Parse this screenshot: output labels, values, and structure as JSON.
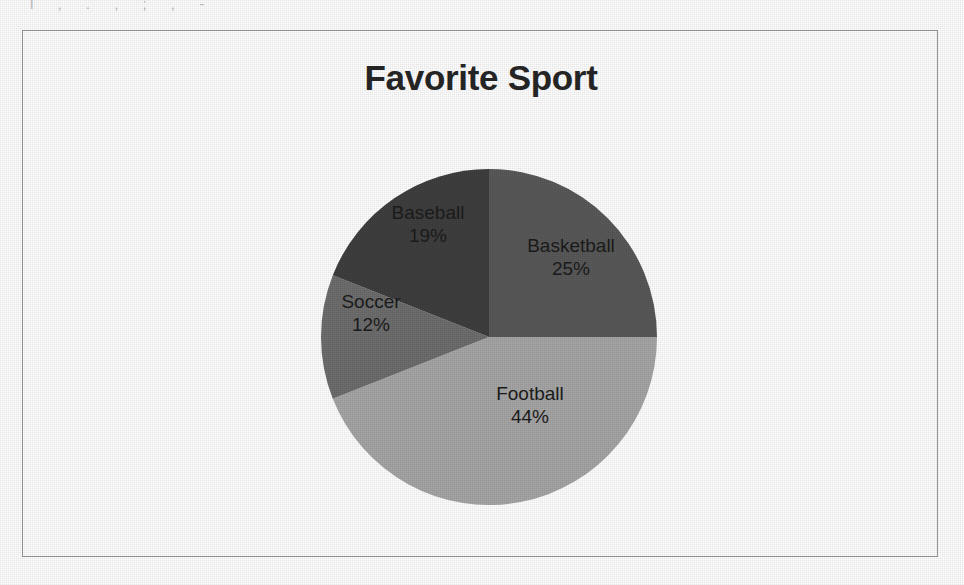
{
  "page": {
    "background_color": "#ffffff",
    "frame_border_color": "#9a9a9a",
    "top_text_remnant": "l  ,   .    ,   ;   ,   -"
  },
  "chart_data": {
    "type": "pie",
    "title": "Favorite Sport",
    "xlabel": "",
    "ylabel": "",
    "legend": "none",
    "labels_position": "inside-slices",
    "start_angle_deg": 0,
    "direction": "clockwise",
    "categories": [
      "Basketball",
      "Football",
      "Soccer",
      "Baseball"
    ],
    "values": [
      25,
      44,
      12,
      19
    ],
    "value_suffix": "%",
    "total": 100,
    "colors": [
      "#595959",
      "#a6a6a6",
      "#6e6e6e",
      "#3f3f3f"
    ],
    "slices": [
      {
        "label": "Basketball",
        "value": 25,
        "display_value": "25%",
        "color": "#595959",
        "start_deg": 0,
        "end_deg": 90,
        "label_x": 570,
        "label_y": 258,
        "label_color": "#1c1c1c"
      },
      {
        "label": "Football",
        "value": 44,
        "display_value": "44%",
        "color": "#a6a6a6",
        "start_deg": 90,
        "end_deg": 248.4,
        "label_x": 529,
        "label_y": 406,
        "label_color": "#1c1c1c"
      },
      {
        "label": "Soccer",
        "value": 12,
        "display_value": "12%",
        "color": "#6e6e6e",
        "start_deg": 248.4,
        "end_deg": 291.6,
        "label_x": 370,
        "label_y": 314,
        "label_color": "#1c1c1c"
      },
      {
        "label": "Baseball",
        "value": 19,
        "display_value": "19%",
        "color": "#3f3f3f",
        "start_deg": 291.6,
        "end_deg": 360,
        "label_x": 427,
        "label_y": 225,
        "label_color": "#1c1c1c"
      }
    ],
    "geometry": {
      "center_x": 488,
      "center_y": 338,
      "radius": 168
    }
  }
}
